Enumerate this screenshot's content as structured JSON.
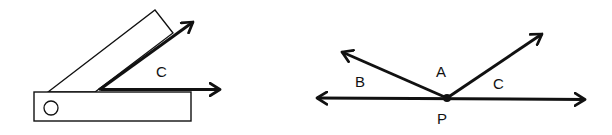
{
  "colors": {
    "stroke": "#111111",
    "background": "#ffffff"
  },
  "left_figure": {
    "description": "protractor with two arms forming angle C",
    "angle_label": "C",
    "pivot_mark": "O"
  },
  "right_figure": {
    "description": "straight line with point P and two rays forming angles B, A, C",
    "labels": {
      "b": "B",
      "a": "A",
      "c": "C",
      "p": "P"
    }
  }
}
